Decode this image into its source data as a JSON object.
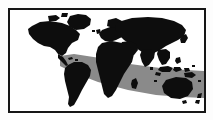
{
  "figure": {
    "type": "world-map",
    "title": "World map with shaded latitudinal band",
    "projection": "equirectangular",
    "frame": {
      "border_color": "#161616",
      "border_width_px": 2,
      "matte_color": "#fdfdfd",
      "plate_color": "#ffffff",
      "left_px": 8,
      "top_px": 8,
      "width_px": 198,
      "height_px": 105
    },
    "layers": [
      {
        "name": "ocean-background",
        "label": "Ocean / background",
        "color": "#ffffff"
      },
      {
        "name": "shaded-band",
        "label": "Shaded diagonal band",
        "color": "#8a8a8a",
        "description": "Gray band sweeping from mid-left downward to the right edge, crossing northern South America, central Africa, the Indian Ocean, Indonesia and northern Australia"
      },
      {
        "name": "landmass-silhouette",
        "label": "Land masses",
        "color": "#0d0d0d",
        "description": "Solid black continent silhouettes"
      }
    ],
    "continents": [
      {
        "name": "north-america",
        "label": "North America"
      },
      {
        "name": "greenland",
        "label": "Greenland"
      },
      {
        "name": "south-america",
        "label": "South America"
      },
      {
        "name": "europe",
        "label": "Europe"
      },
      {
        "name": "africa",
        "label": "Africa"
      },
      {
        "name": "asia",
        "label": "Asia"
      },
      {
        "name": "australia",
        "label": "Australia"
      },
      {
        "name": "indonesia",
        "label": "Indonesian archipelago"
      },
      {
        "name": "japan",
        "label": "Japan"
      },
      {
        "name": "madagascar",
        "label": "Madagascar"
      },
      {
        "name": "new-zealand",
        "label": "New Zealand"
      },
      {
        "name": "british-isles",
        "label": "British Isles"
      }
    ]
  },
  "colors": {
    "land": "#0d0d0d",
    "band": "#8a8a8a",
    "ocean": "#ffffff",
    "frame": "#161616",
    "matte": "#fdfdfd"
  }
}
